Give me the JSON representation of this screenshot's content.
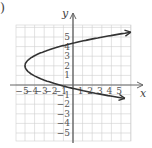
{
  "problem_label": ")",
  "chart_data": {
    "type": "line",
    "title": "",
    "xlabel": "x",
    "ylabel": "y",
    "xlim": [
      -6,
      6
    ],
    "ylim": [
      -6,
      6
    ],
    "grid": true,
    "x_tick_labels": [
      "-5",
      "-4",
      "-3",
      "-2",
      "-1",
      "1",
      "2",
      "3",
      "4",
      "5"
    ],
    "y_tick_labels": [
      "5",
      "4",
      "3",
      "2",
      "1",
      "-1",
      "-2",
      "-3",
      "-4",
      "-5"
    ],
    "series": [
      {
        "name": "sideways parabola",
        "equation": "x = 0.9(y - 2)^2 - 5",
        "vertex": [
          -5,
          2
        ],
        "opens": "right",
        "arrows_at_ends": true,
        "y_intercepts": [
          4.4,
          -0.4
        ],
        "points": [
          [
            5.9,
            5.5
          ],
          [
            2.2,
            4.8
          ],
          [
            0,
            4.4
          ],
          [
            -2.8,
            3.6
          ],
          [
            -4.1,
            3
          ],
          [
            -5,
            2
          ],
          [
            -4.1,
            1
          ],
          [
            -2.8,
            0.4
          ],
          [
            0,
            -0.4
          ],
          [
            2.2,
            -0.8
          ],
          [
            5.7,
            -1.4
          ]
        ]
      }
    ],
    "colors": {
      "curve": "#333333",
      "grid": "#cfcfcf",
      "axis": "#666666"
    }
  }
}
